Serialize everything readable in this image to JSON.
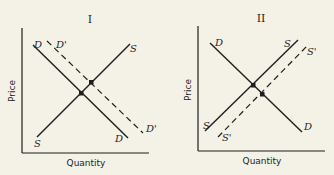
{
  "panels": [
    {
      "title": "I",
      "xlabel": "Quantity",
      "ylabel": "Price",
      "curves": {
        "demand": {
          "top": "D",
          "bottom": "D"
        },
        "demand_shifted": {
          "top": "D'",
          "bottom": "D'",
          "style": "dashed"
        },
        "supply": {
          "top": "S",
          "bottom": "S"
        }
      },
      "description": "Demand shifts right from D to D'; equilibrium moves up along S"
    },
    {
      "title": "II",
      "xlabel": "Quantity",
      "ylabel": "Price",
      "curves": {
        "demand": {
          "top": "D",
          "bottom": "D"
        },
        "supply": {
          "top": "S",
          "bottom": "S"
        },
        "supply_shifted": {
          "top": "S'",
          "bottom": "S'",
          "style": "dashed"
        }
      },
      "description": "Supply shifts right from S to S'; equilibrium moves down along D"
    }
  ],
  "colors": {
    "ink": "#1e1e1e",
    "paper": "#f4f1e6"
  }
}
